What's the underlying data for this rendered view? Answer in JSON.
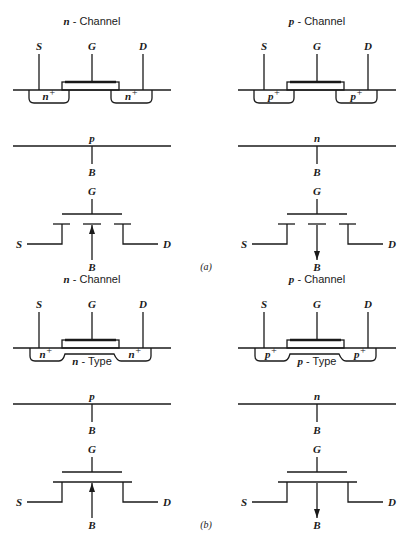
{
  "figure": {
    "panels": [
      {
        "id": "a",
        "caption": "(a)",
        "devices": [
          {
            "channel_type": "n",
            "title_letter": "n",
            "title_text": " - Channel",
            "terminals": {
              "source": "S",
              "gate": "G",
              "drain": "D",
              "body": "B"
            },
            "well_label": "n",
            "well_sup": "+",
            "substrate_label": "p",
            "channel_region_label": null,
            "body_arrow": "inward",
            "channel_line": "broken"
          },
          {
            "channel_type": "p",
            "title_letter": "p",
            "title_text": " - Channel",
            "terminals": {
              "source": "S",
              "gate": "G",
              "drain": "D",
              "body": "B"
            },
            "well_label": "p",
            "well_sup": "+",
            "substrate_label": "n",
            "channel_region_label": null,
            "body_arrow": "outward",
            "channel_line": "broken"
          }
        ]
      },
      {
        "id": "b",
        "caption": "(b)",
        "devices": [
          {
            "channel_type": "n",
            "title_letter": "n",
            "title_text": " - Channel",
            "terminals": {
              "source": "S",
              "gate": "G",
              "drain": "D",
              "body": "B"
            },
            "well_label": "n",
            "well_sup": "+",
            "substrate_label": "p",
            "channel_region_letter": "n",
            "channel_region_text": " - Type",
            "body_arrow": "inward",
            "channel_line": "continuous"
          },
          {
            "channel_type": "p",
            "title_letter": "p",
            "title_text": " - Channel",
            "terminals": {
              "source": "S",
              "gate": "G",
              "drain": "D",
              "body": "B"
            },
            "well_label": "p",
            "well_sup": "+",
            "substrate_label": "n",
            "channel_region_letter": "p",
            "channel_region_text": " - Type",
            "body_arrow": "outward",
            "channel_line": "continuous"
          }
        ]
      }
    ]
  }
}
